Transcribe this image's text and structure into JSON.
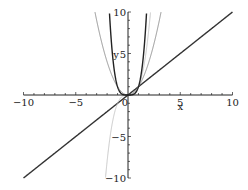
{
  "chart_data": {
    "type": "line",
    "title": "",
    "xlabel": "x",
    "ylabel": "y",
    "xlim": [
      -10,
      10
    ],
    "ylim": [
      -10,
      10
    ],
    "grid": false,
    "legend": "none",
    "x_ticks": [
      -10,
      -5,
      5,
      10
    ],
    "y_ticks": [
      -10,
      -5,
      5,
      10
    ],
    "x_tick_labels": [
      "-10",
      "-5",
      "0",
      "5",
      "10"
    ],
    "y_tick_labels": [
      "-10",
      "-5",
      "5",
      "10"
    ],
    "origin_label": "0",
    "series": [
      {
        "name": "y = x",
        "expr": "x",
        "style": "thick-solid",
        "color": "#333333",
        "x": [
          -10,
          -5,
          0,
          5,
          10
        ],
        "y": [
          -10,
          -5,
          0,
          5,
          10
        ]
      },
      {
        "name": "y = x^2",
        "expr": "x^2",
        "style": "thin-solid",
        "color": "#777777",
        "x": [
          -3.16,
          -2,
          -1,
          0,
          1,
          2,
          3.16
        ],
        "y": [
          10,
          4,
          1,
          0,
          1,
          4,
          10
        ]
      },
      {
        "name": "y = x^3",
        "expr": "x^3",
        "style": "thin-light",
        "color": "#bbbbbb",
        "x": [
          -2.15,
          -1.5,
          -1,
          0,
          1,
          1.5,
          2.15
        ],
        "y": [
          -10,
          -3.375,
          -1,
          0,
          1,
          3.375,
          10
        ]
      },
      {
        "name": "y = x^4",
        "expr": "x^4",
        "style": "thick-solid",
        "color": "#222222",
        "x": [
          -1.78,
          -1.5,
          -1,
          0,
          1,
          1.5,
          1.78
        ],
        "y": [
          10,
          5.06,
          1,
          0,
          1,
          5.06,
          10
        ]
      }
    ]
  }
}
